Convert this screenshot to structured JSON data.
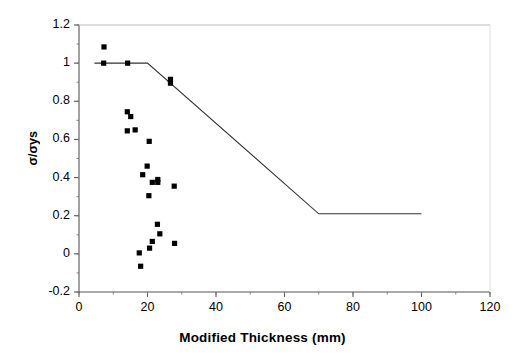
{
  "chart_data": {
    "type": "scatter",
    "title": "",
    "xlabel": "Modified Thickness (mm)",
    "ylabel": "σ/σys",
    "xlim": [
      0,
      120
    ],
    "ylim": [
      -0.2,
      1.2
    ],
    "xticks": [
      "0",
      "20",
      "40",
      "60",
      "80",
      "100",
      "120"
    ],
    "xtick_values": [
      0,
      20,
      40,
      60,
      80,
      100,
      120
    ],
    "yticks": [
      "1.2",
      "1",
      "0.8",
      "0.6",
      "0.4",
      "0.2",
      "0",
      "-0.2"
    ],
    "ytick_values": [
      1.2,
      1,
      0.8,
      0.6,
      0.4,
      0.2,
      0,
      -0.2
    ],
    "xminor_step": 10,
    "grid": false,
    "legend": null,
    "marker": "filled-square",
    "marker_color": "#000000",
    "line_color": "#333333",
    "series": [
      {
        "name": "Test data",
        "type": "scatter",
        "points": [
          [
            7.3,
            1.085
          ],
          [
            7.2,
            1.0
          ],
          [
            14.2,
            1.0
          ],
          [
            26.7,
            0.915
          ],
          [
            26.7,
            0.895
          ],
          [
            14.1,
            0.745
          ],
          [
            15.1,
            0.72
          ],
          [
            14.1,
            0.645
          ],
          [
            16.4,
            0.65
          ],
          [
            20.5,
            0.59
          ],
          [
            19.9,
            0.46
          ],
          [
            18.6,
            0.415
          ],
          [
            21.4,
            0.375
          ],
          [
            23.0,
            0.39
          ],
          [
            23.0,
            0.375
          ],
          [
            27.8,
            0.355
          ],
          [
            20.4,
            0.305
          ],
          [
            22.9,
            0.155
          ],
          [
            23.6,
            0.105
          ],
          [
            21.4,
            0.065
          ],
          [
            27.9,
            0.055
          ],
          [
            20.6,
            0.03
          ],
          [
            17.6,
            0.005
          ],
          [
            18.0,
            -0.065
          ]
        ]
      },
      {
        "name": "Design curve",
        "type": "line",
        "points": [
          [
            4.5,
            1.0
          ],
          [
            20.0,
            1.0
          ],
          [
            70.0,
            0.21
          ],
          [
            100.0,
            0.21
          ]
        ]
      }
    ]
  }
}
